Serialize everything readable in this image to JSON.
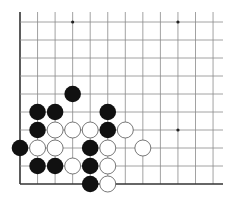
{
  "diagram": {
    "type": "go-board-fragment",
    "edges": [
      "left",
      "bottom"
    ],
    "grid": {
      "columns": 12,
      "rows": 10,
      "origin_x": 20,
      "origin_y": 22,
      "spacing_x": 17.55,
      "spacing_y": 18,
      "line_top": 12,
      "line_right": 223,
      "line_color": "#8a8a8a",
      "edge_color": "#333333"
    },
    "star_points": [
      {
        "col": 3,
        "row": 0
      },
      {
        "col": 9,
        "row": 0
      },
      {
        "col": 9,
        "row": 6
      }
    ],
    "stones": [
      {
        "color": "black",
        "col": 3,
        "row": 4
      },
      {
        "color": "black",
        "col": 1,
        "row": 5
      },
      {
        "color": "black",
        "col": 2,
        "row": 5
      },
      {
        "color": "black",
        "col": 5,
        "row": 5
      },
      {
        "color": "black",
        "col": 1,
        "row": 6
      },
      {
        "color": "white",
        "col": 2,
        "row": 6
      },
      {
        "color": "white",
        "col": 3,
        "row": 6
      },
      {
        "color": "white",
        "col": 4,
        "row": 6
      },
      {
        "color": "black",
        "col": 5,
        "row": 6
      },
      {
        "color": "white",
        "col": 6,
        "row": 6
      },
      {
        "color": "black",
        "col": 0,
        "row": 7
      },
      {
        "color": "white",
        "col": 1,
        "row": 7
      },
      {
        "color": "white",
        "col": 2,
        "row": 7
      },
      {
        "color": "black",
        "col": 4,
        "row": 7
      },
      {
        "color": "white",
        "col": 5,
        "row": 7
      },
      {
        "color": "white",
        "col": 7,
        "row": 7
      },
      {
        "color": "black",
        "col": 1,
        "row": 8
      },
      {
        "color": "black",
        "col": 2,
        "row": 8
      },
      {
        "color": "white",
        "col": 3,
        "row": 8
      },
      {
        "color": "black",
        "col": 4,
        "row": 8
      },
      {
        "color": "white",
        "col": 5,
        "row": 8
      },
      {
        "color": "black",
        "col": 4,
        "row": 9
      },
      {
        "color": "white",
        "col": 5,
        "row": 9
      }
    ],
    "colors": {
      "black_stone": "#111111",
      "white_stone": "#ffffff",
      "white_stone_outline": "#555555",
      "background": "#ffffff"
    }
  }
}
